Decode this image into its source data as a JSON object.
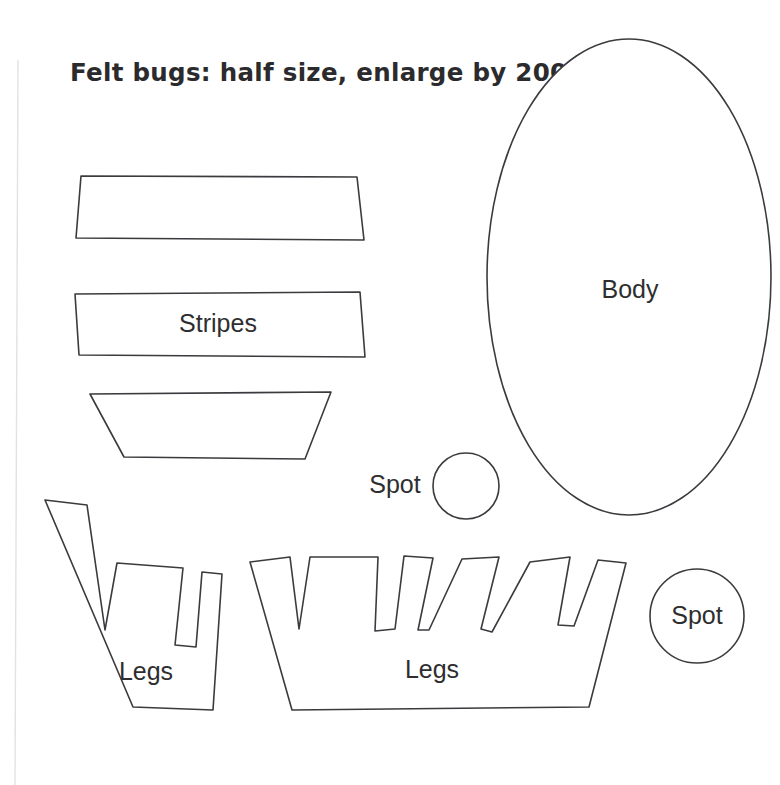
{
  "page": {
    "title_note": "Felt bugs: half size, enlarge by 200%",
    "background_color": "#ffffff",
    "ink_color": "#3b3b3f",
    "label_color": "#2e2e30",
    "width": 780,
    "height": 785
  },
  "pattern": {
    "name": "felt-bugs-sewing-pattern",
    "pieces": [
      {
        "id": "stripe-top",
        "label": "",
        "kind": "quadrilateral",
        "points": "81,176 357,177 364,240 76,238"
      },
      {
        "id": "stripe-middle",
        "label": "Stripes",
        "label_x": 218,
        "label_y": 325,
        "kind": "quadrilateral",
        "points": "75,294 360,292 365,357 79,355"
      },
      {
        "id": "stripe-bottom",
        "label": "",
        "kind": "trapezoid",
        "points": "90,394 331,392 305,459 124,457"
      },
      {
        "id": "body",
        "label": "Body",
        "label_x": 630,
        "label_y": 291,
        "kind": "ellipse",
        "cx": 629,
        "cy": 277,
        "rx": 142,
        "ry": 238
      },
      {
        "id": "spot-small",
        "label": "",
        "kind": "circle",
        "cx": 466,
        "cy": 486,
        "r": 33
      },
      {
        "id": "spot-small-label",
        "label": "Spot",
        "label_x": 395,
        "label_y": 486,
        "kind": "text"
      },
      {
        "id": "spot-large",
        "label": "Spot",
        "label_x": 697,
        "label_y": 617,
        "kind": "circle",
        "cx": 697,
        "cy": 616,
        "r": 47
      },
      {
        "id": "legs-left",
        "label": "Legs",
        "label_x": 146,
        "label_y": 673,
        "kind": "comb-polygon",
        "points": "45,500 87,505 105,630 117,563 183,568 175,645 196,647 202,572 222,574 213,710 133,707"
      },
      {
        "id": "legs-right",
        "label": "Legs",
        "label_x": 432,
        "label_y": 671,
        "kind": "comb-polygon",
        "points": "250,562 290,557 299,629 310,557 378,557 375,631 395,629 404,556 433,558 418,630 429,630 462,559 499,557 481,629 492,632 530,562 570,557 558,625 574,626 598,560 626,563 589,707 292,710"
      }
    ]
  },
  "edges": {
    "left_scan_line": {
      "x": 18,
      "y1": 60,
      "y2": 785
    }
  }
}
